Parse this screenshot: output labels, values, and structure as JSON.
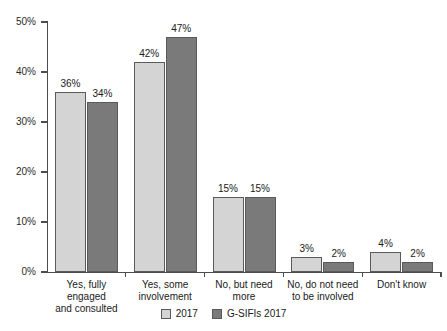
{
  "chart_data": {
    "type": "bar",
    "title": "",
    "subtitle": "",
    "xlabel": "",
    "ylabel": "",
    "ylim": [
      0,
      50
    ],
    "ytick_labels": [
      "0%",
      "10%",
      "20%",
      "30%",
      "40%",
      "50%"
    ],
    "ytick_values": [
      0,
      10,
      20,
      30,
      40,
      50
    ],
    "grid": false,
    "legend_position": "bottom-center",
    "categories": [
      "Yes, fully engaged and consulted",
      "Yes, some involvement",
      "No, but need more",
      "No, do not need to be involved",
      "Don't know"
    ],
    "category_lines": [
      [
        "Yes, fully engaged",
        "and consulted"
      ],
      [
        "Yes, some",
        "involvement"
      ],
      [
        "No, but need more"
      ],
      [
        "No, do not need",
        "to be involved"
      ],
      [
        "Don't know"
      ]
    ],
    "series": [
      {
        "name": "2017",
        "color": "#d4d4d4",
        "values": [
          36,
          42,
          15,
          3,
          4
        ],
        "labels": [
          "36%",
          "42%",
          "15%",
          "3%",
          "4%"
        ]
      },
      {
        "name": "G-SIFIs 2017",
        "color": "#7a7a7a",
        "values": [
          34,
          47,
          15,
          2,
          2
        ],
        "labels": [
          "34%",
          "47%",
          "15%",
          "2%",
          "2%"
        ]
      }
    ]
  },
  "legend": {
    "items": [
      {
        "label": "2017",
        "swatch": "s1"
      },
      {
        "label": "G-SIFIs 2017",
        "swatch": "s2"
      }
    ]
  }
}
